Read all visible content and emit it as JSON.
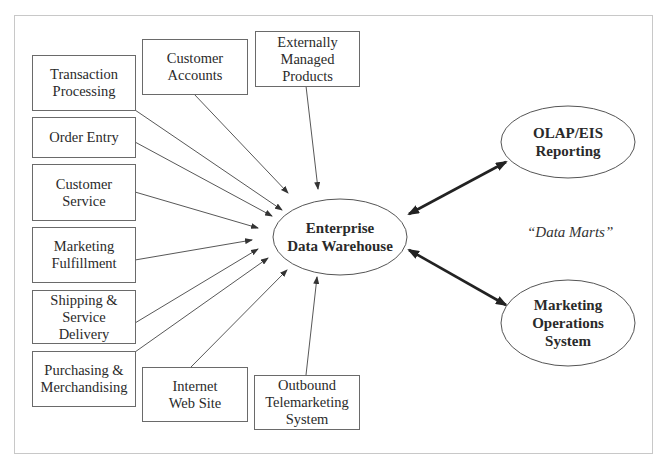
{
  "diagram": {
    "title": "",
    "hub": {
      "label": "Enterprise\nData Warehouse"
    },
    "sources": [
      {
        "id": "transaction-processing",
        "label": "Transaction\nProcessing"
      },
      {
        "id": "order-entry",
        "label": "Order Entry"
      },
      {
        "id": "customer-service",
        "label": "Customer\nService"
      },
      {
        "id": "marketing-fulfillment",
        "label": "Marketing\nFulfillment"
      },
      {
        "id": "shipping-service-delivery",
        "label": "Shipping &\nService\nDelivery"
      },
      {
        "id": "purchasing-merchandising",
        "label": "Purchasing &\nMerchandising"
      },
      {
        "id": "customer-accounts",
        "label": "Customer\nAccounts"
      },
      {
        "id": "externally-managed-products",
        "label": "Externally\nManaged\nProducts"
      },
      {
        "id": "internet-web-site",
        "label": "Internet\nWeb Site"
      },
      {
        "id": "outbound-telemarketing-system",
        "label": "Outbound\nTelemarketing\nSystem"
      }
    ],
    "data_marts": [
      {
        "id": "olap-eis-reporting",
        "label": "OLAP/EIS\nReporting"
      },
      {
        "id": "marketing-operations-system",
        "label": "Marketing\nOperations\nSystem"
      }
    ],
    "data_marts_note": "“Data Marts”",
    "edges": [
      {
        "from": "transaction-processing",
        "to": "hub",
        "direction": "one-way"
      },
      {
        "from": "order-entry",
        "to": "hub",
        "direction": "one-way"
      },
      {
        "from": "customer-service",
        "to": "hub",
        "direction": "one-way"
      },
      {
        "from": "marketing-fulfillment",
        "to": "hub",
        "direction": "one-way"
      },
      {
        "from": "shipping-service-delivery",
        "to": "hub",
        "direction": "one-way"
      },
      {
        "from": "purchasing-merchandising",
        "to": "hub",
        "direction": "one-way"
      },
      {
        "from": "customer-accounts",
        "to": "hub",
        "direction": "one-way"
      },
      {
        "from": "externally-managed-products",
        "to": "hub",
        "direction": "one-way"
      },
      {
        "from": "internet-web-site",
        "to": "hub",
        "direction": "one-way"
      },
      {
        "from": "outbound-telemarketing-system",
        "to": "hub",
        "direction": "one-way"
      },
      {
        "from": "hub",
        "to": "olap-eis-reporting",
        "direction": "two-way"
      },
      {
        "from": "hub",
        "to": "marketing-operations-system",
        "direction": "two-way"
      }
    ]
  }
}
